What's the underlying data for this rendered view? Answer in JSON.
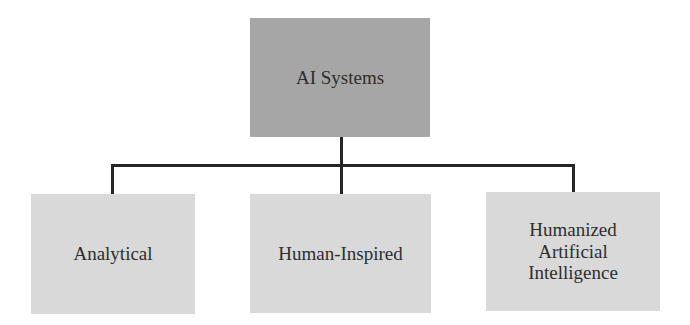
{
  "diagram": {
    "type": "hierarchy",
    "root": {
      "label": "AI Systems",
      "fill": "#a6a6a6"
    },
    "children": [
      {
        "label": "Analytical",
        "fill": "#d9d9d9"
      },
      {
        "label": "Human-Inspired",
        "fill": "#d9d9d9"
      },
      {
        "label": "Humanized Artificial Intelligence",
        "lines": [
          "Humanized",
          "Artificial",
          "Intelligence"
        ],
        "fill": "#d9d9d9"
      }
    ],
    "connector_color": "#262626"
  }
}
